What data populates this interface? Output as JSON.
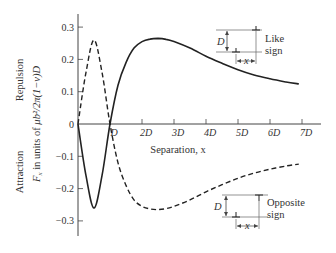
{
  "chart_data": {
    "type": "line",
    "title": "",
    "xlabel": "Separation, x",
    "ylabel_top": "Repulsion",
    "ylabel_bottom": "Attraction",
    "ylabel_units": "F_x in units of μb²/2π(1−ν)D",
    "x_unit": "D",
    "xlim": [
      0,
      7.5
    ],
    "ylim": [
      -0.35,
      0.35
    ],
    "x_ticks": [
      {
        "value": 1,
        "label": "D"
      },
      {
        "value": 2,
        "label": "2D"
      },
      {
        "value": 3,
        "label": "3D"
      },
      {
        "value": 4,
        "label": "4D"
      },
      {
        "value": 5,
        "label": "5D"
      },
      {
        "value": 6,
        "label": "6D"
      },
      {
        "value": 7,
        "label": "7D"
      }
    ],
    "y_ticks": [
      {
        "value": 0.3,
        "label": "0.3"
      },
      {
        "value": 0.2,
        "label": "0.2"
      },
      {
        "value": 0.1,
        "label": "0.1"
      },
      {
        "value": 0,
        "label": "0"
      },
      {
        "value": -0.1,
        "label": "−0.1"
      },
      {
        "value": -0.2,
        "label": "−0.2"
      },
      {
        "value": -0.3,
        "label": "−0.3"
      }
    ],
    "grid": false,
    "series": [
      {
        "name": "Like sign",
        "style": "solid",
        "x": [
          0,
          0.25,
          0.5,
          0.75,
          1.0,
          1.25,
          1.5,
          1.75,
          2.0,
          2.25,
          2.5,
          2.75,
          3.0,
          3.5,
          4.0,
          4.5,
          5.0,
          5.5,
          6.0,
          6.5,
          6.9
        ],
        "y": [
          0,
          -0.16,
          -0.26,
          -0.16,
          0,
          0.12,
          0.19,
          0.235,
          0.255,
          0.263,
          0.265,
          0.262,
          0.255,
          0.235,
          0.21,
          0.188,
          0.168,
          0.152,
          0.14,
          0.13,
          0.124
        ]
      },
      {
        "name": "Opposite sign",
        "style": "dashed",
        "x": [
          0,
          0.25,
          0.5,
          0.75,
          1.0,
          1.25,
          1.5,
          1.75,
          2.0,
          2.25,
          2.5,
          2.75,
          3.0,
          3.5,
          4.0,
          4.5,
          5.0,
          5.5,
          6.0,
          6.5,
          6.9
        ],
        "y": [
          0,
          0.16,
          0.26,
          0.16,
          0,
          -0.12,
          -0.19,
          -0.235,
          -0.255,
          -0.263,
          -0.265,
          -0.262,
          -0.255,
          -0.235,
          -0.21,
          -0.188,
          -0.168,
          -0.152,
          -0.14,
          -0.13,
          -0.124
        ]
      }
    ],
    "annotations": [
      {
        "text": "Like sign",
        "position": "upper right inset",
        "labels": [
          "D",
          "x"
        ]
      },
      {
        "text": "Opposite sign",
        "position": "lower right inset",
        "labels": [
          "D",
          "x"
        ]
      }
    ]
  },
  "labels": {
    "ylabel_repulsion": "Repulsion",
    "ylabel_attraction": "Attraction",
    "ylabel_units_pre": "F",
    "ylabel_units_sub": "x",
    "ylabel_units_mid": " in units of ",
    "ylabel_units_formula": "μb²/2π(1−ν)D",
    "xlabel": "Separation, x",
    "like_line1": "Like",
    "like_line2": "sign",
    "opp_line1": "Opposite",
    "opp_line2": "sign",
    "inset_D": "D",
    "inset_x": "x",
    "origin": "0"
  }
}
